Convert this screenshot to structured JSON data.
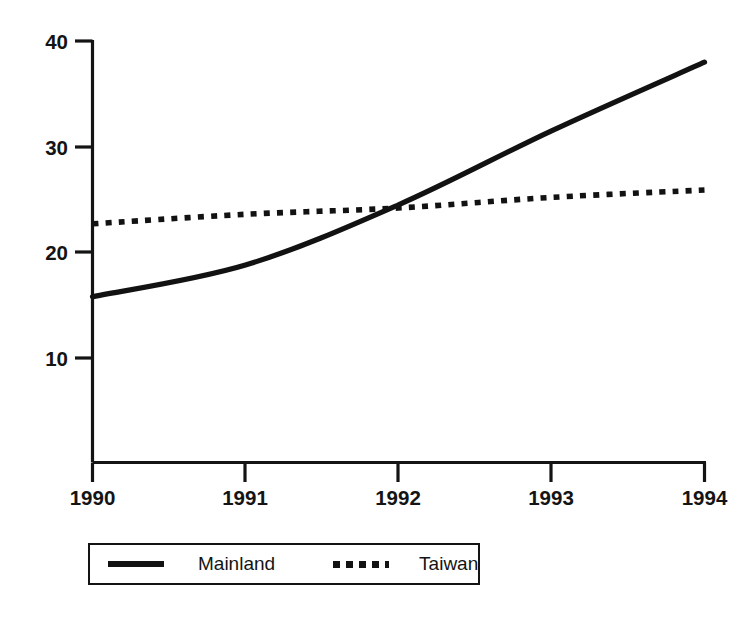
{
  "chart_data": {
    "type": "line",
    "title": "",
    "subtitle": "",
    "xlabel": "",
    "ylabel": "",
    "x": [
      1990,
      1991,
      1992,
      1993,
      1994
    ],
    "xtick_labels": [
      "1990",
      "1991",
      "1992",
      "1993",
      "1994"
    ],
    "ytick_labels": [
      "40",
      "30",
      "20",
      "10"
    ],
    "ytick_values": [
      40,
      30,
      20,
      10
    ],
    "xlim": [
      1990,
      1994
    ],
    "ylim": [
      0,
      42
    ],
    "grid": false,
    "legend_position": "bottom-center",
    "series": [
      {
        "name": "Mainland",
        "style": "solid",
        "color": "#121212",
        "values": [
          15.8,
          18.8,
          24.5,
          31.5,
          38.0
        ]
      },
      {
        "name": "Taiwan",
        "style": "dotted",
        "color": "#121212",
        "values": [
          22.7,
          23.6,
          24.2,
          25.2,
          25.9
        ]
      }
    ],
    "annotations": []
  },
  "legend": {
    "entries": [
      {
        "label": "Mainland",
        "style": "solid"
      },
      {
        "label": "Taiwan",
        "style": "dotted"
      }
    ]
  },
  "axes": {
    "y_ticks": [
      {
        "label": "40",
        "value": 40
      },
      {
        "label": "30",
        "value": 30
      },
      {
        "label": "20",
        "value": 20
      },
      {
        "label": "10",
        "value": 10
      }
    ],
    "x_ticks": [
      {
        "label": "1990",
        "value": 1990
      },
      {
        "label": "1991",
        "value": 1991
      },
      {
        "label": "1992",
        "value": 1992
      },
      {
        "label": "1993",
        "value": 1993
      },
      {
        "label": "1994",
        "value": 1994
      }
    ]
  }
}
